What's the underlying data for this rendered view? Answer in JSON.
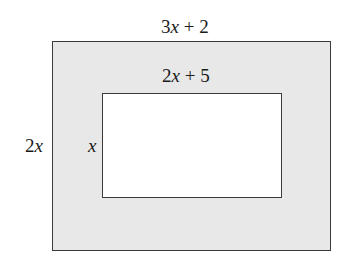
{
  "diagram": {
    "outer_rectangle": {
      "width_label": {
        "coefficient": "3",
        "variable": "x",
        "rest": " + 2"
      },
      "height_label": {
        "coefficient": "2",
        "variable": "x",
        "rest": ""
      },
      "fill_color": "#e8e8e8",
      "border_color": "#3a3a3a"
    },
    "inner_rectangle": {
      "width_label": {
        "coefficient": "2",
        "variable": "x",
        "rest": " + 5"
      },
      "height_label": {
        "coefficient": "",
        "variable": "x",
        "rest": ""
      },
      "fill_color": "#ffffff",
      "border_color": "#3a3a3a"
    }
  }
}
